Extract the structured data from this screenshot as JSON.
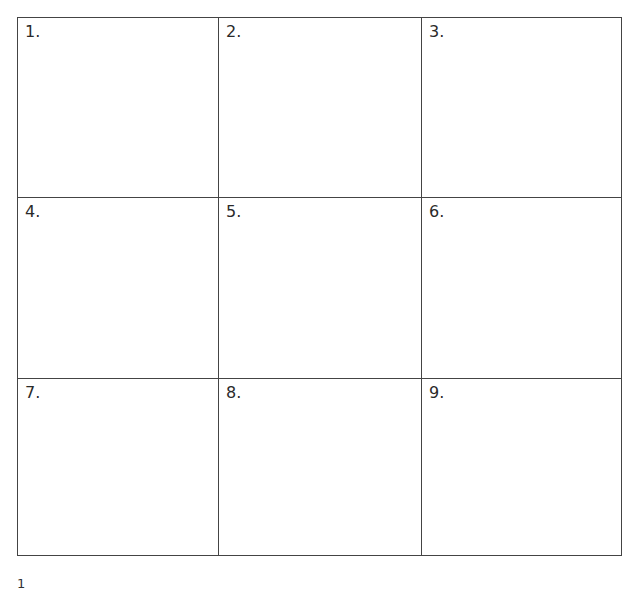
{
  "grid": {
    "cells": [
      {
        "label": "1."
      },
      {
        "label": "2."
      },
      {
        "label": "3."
      },
      {
        "label": "4."
      },
      {
        "label": "5."
      },
      {
        "label": "6."
      },
      {
        "label": "7."
      },
      {
        "label": "8."
      },
      {
        "label": "9."
      }
    ]
  },
  "footer": {
    "page_number": "1"
  }
}
